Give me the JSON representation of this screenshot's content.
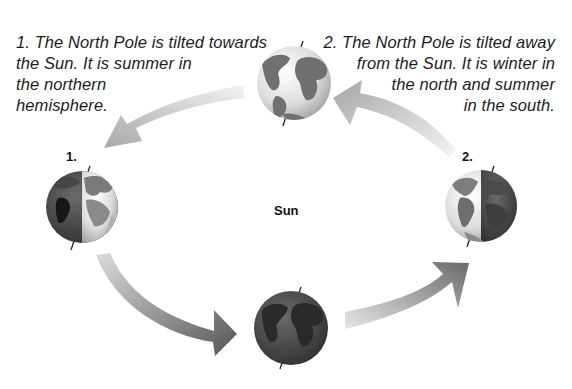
{
  "diagram": {
    "center_label": "Sun",
    "captions": [
      {
        "id": "1",
        "lines": [
          "1. The North Pole is tilted towards",
          "the Sun. It is summer in",
          "the northern",
          "hemisphere."
        ]
      },
      {
        "id": "2",
        "lines": [
          "2. The North Pole is tilted away",
          "from the Sun. It is winter in",
          "the north and summer",
          "in the south."
        ]
      }
    ],
    "position_labels": [
      "1.",
      "2."
    ],
    "nodes": [
      {
        "name": "earth-position-1",
        "label": "1.",
        "cx": 82,
        "cy": 207,
        "r": 36,
        "lit_side": "right"
      },
      {
        "name": "earth-top",
        "cx": 294,
        "cy": 83,
        "r": 37,
        "lit_side": "full"
      },
      {
        "name": "earth-position-2",
        "label": "2.",
        "cx": 481,
        "cy": 206,
        "r": 36,
        "lit_side": "left"
      },
      {
        "name": "earth-bottom",
        "cx": 291,
        "cy": 328,
        "r": 37,
        "lit_side": "none"
      }
    ],
    "edges": [
      {
        "from": "earth-top",
        "to": "earth-position-1",
        "direction": "counter-clockwise"
      },
      {
        "from": "earth-position-1",
        "to": "earth-bottom",
        "direction": "counter-clockwise"
      },
      {
        "from": "earth-bottom",
        "to": "earth-position-2",
        "direction": "counter-clockwise"
      },
      {
        "from": "earth-position-2",
        "to": "earth-top",
        "direction": "counter-clockwise"
      }
    ]
  }
}
